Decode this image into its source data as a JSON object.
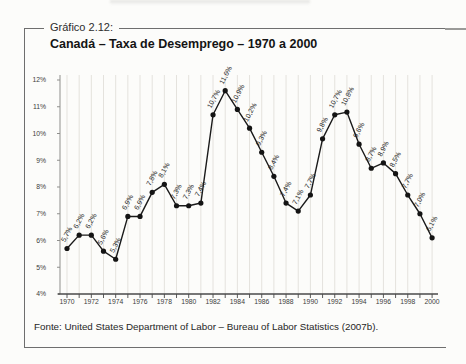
{
  "figure": {
    "label": "Gráfico 2.12:",
    "title": "Canadá – Taxa de Desemprego – 1970 a 2000",
    "source": "Fonte: United States Department of Labor – Bureau of Labor Statistics (2007b)."
  },
  "chart_data": {
    "type": "line",
    "title": "Canadá – Taxa de Desemprego – 1970 a 2000",
    "x": [
      1970,
      1971,
      1972,
      1973,
      1974,
      1975,
      1976,
      1977,
      1978,
      1979,
      1980,
      1981,
      1982,
      1983,
      1984,
      1985,
      1986,
      1987,
      1988,
      1989,
      1990,
      1991,
      1992,
      1993,
      1994,
      1995,
      1996,
      1997,
      1998,
      1999,
      2000
    ],
    "values": [
      5.7,
      6.2,
      6.2,
      5.6,
      5.3,
      6.9,
      6.9,
      7.8,
      8.1,
      7.3,
      7.3,
      7.4,
      10.7,
      11.6,
      10.9,
      10.2,
      9.3,
      8.4,
      7.4,
      7.1,
      7.7,
      9.8,
      10.7,
      10.8,
      9.6,
      8.7,
      8.9,
      8.5,
      7.7,
      7.0,
      6.1
    ],
    "point_labels": [
      "5,7%",
      "6,2%",
      "6,2%",
      "5,6%",
      "5,3%",
      "6,9%",
      "6,9%",
      "7,8%",
      "8,1%",
      "7,3%",
      "7,3%",
      "7,4%",
      "10,7%",
      "11,6%",
      "10,9%",
      "10,2%",
      "9,3%",
      "8,4%",
      "7,4%",
      "7,1%",
      "7,7%",
      "9,8%",
      "10,7%",
      "10,8%",
      "9,6%",
      "8,7%",
      "8,9%",
      "8,5%",
      "7,7%",
      "7,0%",
      "6,1%"
    ],
    "ylim": [
      4,
      12
    ],
    "ytick_step": 1,
    "ytick_labels": [
      "4%",
      "5%",
      "6%",
      "7%",
      "8%",
      "9%",
      "10%",
      "11%",
      "12%"
    ],
    "xtick_labels": [
      "1970",
      "1972",
      "1974",
      "1976",
      "1978",
      "1980",
      "1982",
      "1984",
      "1986",
      "1988",
      "1990",
      "1992",
      "1994",
      "1996",
      "1998",
      "2000"
    ],
    "grid": "vertical",
    "legend": "none",
    "line_color": "#1a1a1a",
    "marker": "filled-circle",
    "grid_color": "#e4e2dd",
    "axis_color": "#4a4a4a"
  }
}
